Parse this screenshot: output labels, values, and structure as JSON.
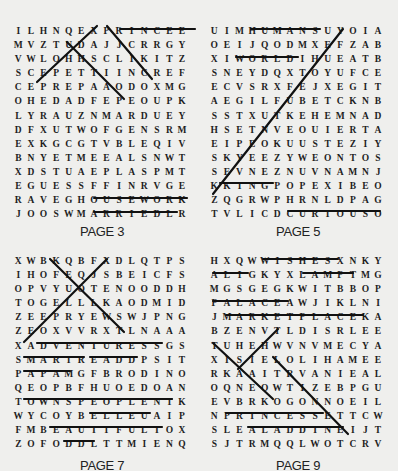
{
  "puzzles": [
    {
      "label": "PAGE 3",
      "rows": [
        [
          "I",
          "L",
          "H",
          "N",
          "Q",
          "E",
          "X",
          "P",
          "R",
          "I",
          "N",
          "C",
          "E",
          "E"
        ],
        [
          "M",
          "V",
          "Z",
          "T",
          "U",
          "D",
          "A",
          "J",
          "J",
          "C",
          "R",
          "R",
          "G",
          "Y"
        ],
        [
          "V",
          "W",
          "L",
          "O",
          "H",
          "H",
          "S",
          "C",
          "L",
          "I",
          "K",
          "I",
          "T",
          "Z"
        ],
        [
          "S",
          "C",
          "E",
          "P",
          "E",
          "T",
          "T",
          "I",
          "I",
          "N",
          "C",
          "R",
          "E",
          "F"
        ],
        [
          "C",
          "E",
          "P",
          "R",
          "E",
          "P",
          "A",
          "A",
          "O",
          "D",
          "O",
          "X",
          "M",
          "G"
        ],
        [
          "O",
          "H",
          "E",
          "D",
          "A",
          "D",
          "F",
          "E",
          "P",
          "E",
          "O",
          "U",
          "P",
          "K"
        ],
        [
          "L",
          "Y",
          "R",
          "A",
          "U",
          "Z",
          "N",
          "M",
          "A",
          "R",
          "D",
          "U",
          "E",
          "Y"
        ],
        [
          "D",
          "F",
          "X",
          "U",
          "T",
          "W",
          "O",
          "F",
          "G",
          "E",
          "N",
          "S",
          "R",
          "M"
        ],
        [
          "E",
          "X",
          "K",
          "G",
          "C",
          "G",
          "T",
          "V",
          "B",
          "L",
          "E",
          "Q",
          "I",
          "V"
        ],
        [
          "B",
          "N",
          "Y",
          "E",
          "T",
          "M",
          "E",
          "E",
          "A",
          "L",
          "S",
          "N",
          "W",
          "T"
        ],
        [
          "X",
          "D",
          "S",
          "T",
          "U",
          "A",
          "E",
          "P",
          "L",
          "A",
          "S",
          "P",
          "M",
          "T"
        ],
        [
          "E",
          "G",
          "U",
          "E",
          "S",
          "S",
          "F",
          "F",
          "I",
          "N",
          "R",
          "V",
          "G",
          "E"
        ],
        [
          "R",
          "A",
          "V",
          "E",
          "G",
          "H",
          "O",
          "U",
          "S",
          "E",
          "W",
          "O",
          "R",
          "K"
        ],
        [
          "J",
          "O",
          "O",
          "S",
          "W",
          "M",
          "A",
          "R",
          "R",
          "I",
          "E",
          "D",
          "L",
          "R"
        ]
      ]
    },
    {
      "label": "PAGE 5",
      "rows": [
        [
          "U",
          "I",
          "M",
          "H",
          "U",
          "M",
          "A",
          "N",
          "S",
          "U",
          "Y",
          "O",
          "I",
          "A"
        ],
        [
          "O",
          "E",
          "I",
          "J",
          "Q",
          "O",
          "D",
          "M",
          "X",
          "E",
          "F",
          "Z",
          "A",
          "B"
        ],
        [
          "X",
          "I",
          "W",
          "O",
          "R",
          "L",
          "D",
          "I",
          "H",
          "U",
          "E",
          "A",
          "T",
          "B"
        ],
        [
          "S",
          "N",
          "E",
          "Y",
          "D",
          "Q",
          "X",
          "T",
          "O",
          "Y",
          "U",
          "F",
          "C",
          "E"
        ],
        [
          "E",
          "C",
          "V",
          "S",
          "R",
          "X",
          "F",
          "E",
          "J",
          "X",
          "E",
          "G",
          "I",
          "T"
        ],
        [
          "A",
          "E",
          "G",
          "I",
          "L",
          "F",
          "U",
          "B",
          "E",
          "T",
          "C",
          "K",
          "N",
          "B"
        ],
        [
          "S",
          "S",
          "T",
          "X",
          "U",
          "T",
          "K",
          "E",
          "H",
          "E",
          "M",
          "N",
          "A",
          "D"
        ],
        [
          "H",
          "S",
          "E",
          "T",
          "N",
          "V",
          "E",
          "O",
          "U",
          "I",
          "E",
          "R",
          "T",
          "A"
        ],
        [
          "E",
          "I",
          "P",
          "E",
          "O",
          "K",
          "U",
          "U",
          "S",
          "T",
          "E",
          "Z",
          "I",
          "Y"
        ],
        [
          "S",
          "K",
          "Y",
          "E",
          "E",
          "Z",
          "Y",
          "W",
          "E",
          "O",
          "N",
          "T",
          "O",
          "S"
        ],
        [
          "S",
          "E",
          "V",
          "N",
          "E",
          "Z",
          "N",
          "U",
          "V",
          "N",
          "A",
          "M",
          "N",
          "J"
        ],
        [
          "K",
          "K",
          "I",
          "N",
          "G",
          "P",
          "O",
          "P",
          "E",
          "X",
          "I",
          "B",
          "E",
          "O"
        ],
        [
          "Z",
          "Q",
          "G",
          "R",
          "W",
          "P",
          "H",
          "R",
          "N",
          "L",
          "D",
          "P",
          "A",
          "G"
        ],
        [
          "T",
          "V",
          "L",
          "I",
          "C",
          "D",
          "C",
          "U",
          "R",
          "I",
          "O",
          "U",
          "S",
          "O"
        ]
      ]
    },
    {
      "label": "PAGE 7",
      "rows": [
        [
          "X",
          "W",
          "B",
          "K",
          "Q",
          "B",
          "F",
          "X",
          "D",
          "L",
          "Q",
          "T",
          "P",
          "S"
        ],
        [
          "I",
          "H",
          "O",
          "F",
          "E",
          "Q",
          "J",
          "S",
          "B",
          "E",
          "I",
          "C",
          "F",
          "S"
        ],
        [
          "O",
          "P",
          "V",
          "Y",
          "U",
          "O",
          "T",
          "E",
          "N",
          "O",
          "O",
          "D",
          "D",
          "H"
        ],
        [
          "T",
          "O",
          "G",
          "E",
          "L",
          "L",
          "L",
          "K",
          "A",
          "O",
          "D",
          "M",
          "I",
          "D"
        ],
        [
          "Z",
          "E",
          "E",
          "P",
          "R",
          "Y",
          "E",
          "W",
          "S",
          "W",
          "J",
          "P",
          "N",
          "G"
        ],
        [
          "Z",
          "E",
          "O",
          "X",
          "V",
          "V",
          "R",
          "X",
          "T",
          "L",
          "N",
          "A",
          "A",
          "A"
        ],
        [
          "X",
          "A",
          "D",
          "V",
          "E",
          "N",
          "T",
          "U",
          "R",
          "E",
          "S",
          "S",
          "G",
          "S"
        ],
        [
          "S",
          "M",
          "A",
          "R",
          "T",
          "R",
          "E",
          "A",
          "D",
          "D",
          "P",
          "S",
          "I",
          "T"
        ],
        [
          "P",
          "A",
          "P",
          "A",
          "M",
          "G",
          "F",
          "B",
          "R",
          "O",
          "D",
          "I",
          "N",
          "O"
        ],
        [
          "Q",
          "E",
          "O",
          "P",
          "B",
          "F",
          "H",
          "U",
          "O",
          "E",
          "D",
          "O",
          "A",
          "N"
        ],
        [
          "T",
          "O",
          "W",
          "N",
          "S",
          "P",
          "E",
          "O",
          "P",
          "L",
          "E",
          "N",
          "T",
          "K"
        ],
        [
          "W",
          "Y",
          "C",
          "O",
          "Y",
          "B",
          "E",
          "L",
          "L",
          "E",
          "U",
          "A",
          "I",
          "P"
        ],
        [
          "F",
          "M",
          "B",
          "E",
          "A",
          "U",
          "T",
          "I",
          "F",
          "U",
          "L",
          "T",
          "O",
          "X"
        ],
        [
          "Z",
          "O",
          "F",
          "O",
          "D",
          "D",
          "L",
          "T",
          "T",
          "M",
          "I",
          "E",
          "N",
          "Q"
        ]
      ]
    },
    {
      "label": "PAGE 9",
      "rows": [
        [
          "H",
          "X",
          "Q",
          "W",
          "W",
          "I",
          "S",
          "H",
          "E",
          "S",
          "X",
          "N",
          "K",
          "Y"
        ],
        [
          "A",
          "L",
          "I",
          "G",
          "K",
          "Y",
          "X",
          "L",
          "A",
          "M",
          "P",
          "T",
          "M",
          "G"
        ],
        [
          "M",
          "G",
          "S",
          "G",
          "E",
          "G",
          "K",
          "W",
          "I",
          "T",
          "B",
          "B",
          "O",
          "P"
        ],
        [
          "P",
          "A",
          "L",
          "A",
          "C",
          "E",
          "A",
          "W",
          "J",
          "I",
          "K",
          "L",
          "N",
          "I"
        ],
        [
          "J",
          "M",
          "A",
          "R",
          "K",
          "E",
          "T",
          "P",
          "L",
          "A",
          "C",
          "E",
          "K",
          "A"
        ],
        [
          "B",
          "Z",
          "E",
          "N",
          "V",
          "T",
          "L",
          "D",
          "I",
          "S",
          "R",
          "L",
          "E",
          "E"
        ],
        [
          "T",
          "U",
          "H",
          "E",
          "H",
          "W",
          "V",
          "N",
          "V",
          "M",
          "E",
          "C",
          "Y",
          "A"
        ],
        [
          "X",
          "I",
          "S",
          "I",
          "E",
          "L",
          "O",
          "L",
          "I",
          "H",
          "A",
          "M",
          "E",
          "E"
        ],
        [
          "R",
          "K",
          "A",
          "A",
          "I",
          "T",
          "R",
          "V",
          "A",
          "N",
          "I",
          "E",
          "A",
          "L"
        ],
        [
          "O",
          "Q",
          "N",
          "E",
          "O",
          "W",
          "T",
          "I",
          "Z",
          "E",
          "B",
          "P",
          "G",
          "U"
        ],
        [
          "E",
          "V",
          "B",
          "R",
          "K",
          "O",
          "G",
          "O",
          "N",
          "N",
          "O",
          "E",
          "I",
          "L"
        ],
        [
          "N",
          "P",
          "R",
          "I",
          "N",
          "C",
          "E",
          "S",
          "S",
          "E",
          "T",
          "T",
          "C",
          "W"
        ],
        [
          "S",
          "L",
          "E",
          "A",
          "L",
          "A",
          "D",
          "D",
          "I",
          "N",
          "E",
          "I",
          "J",
          "T"
        ],
        [
          "S",
          "J",
          "T",
          "R",
          "M",
          "Q",
          "Q",
          "L",
          "W",
          "O",
          "T",
          "C",
          "R",
          "V"
        ]
      ]
    }
  ]
}
